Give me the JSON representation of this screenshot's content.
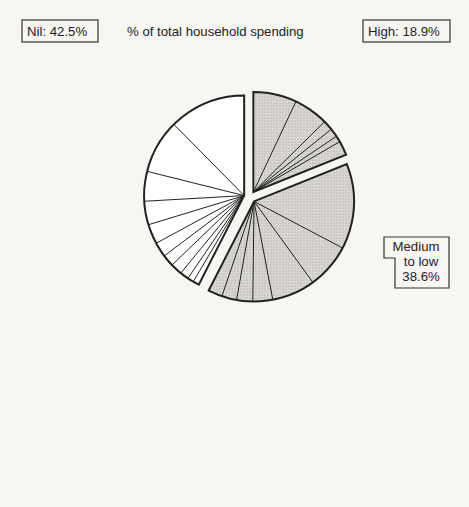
{
  "chart_data": {
    "type": "pie",
    "title": "% of total household spending",
    "groups": [
      {
        "name": "High",
        "label": "High: 18.9%",
        "total": 18.9,
        "fill": "hatched",
        "slices": [
          {
            "label": "Alcohol",
            "value": 7.0
          },
          {
            "label": "Catering and accommodation",
            "value": 5.6
          },
          {
            "label": "Miscellaneous recreational goods",
            "value": 1.6
          },
          {
            "label": "Household maintenance",
            "value": 1.4
          },
          {
            "label": "Domestic services",
            "value": 1.0
          },
          {
            "label": "Other services",
            "value": 2.3
          }
        ]
      },
      {
        "name": "Medium to low",
        "label_lines": [
          "Medium",
          "to low",
          "38.6%"
        ],
        "total": 38.6,
        "fill": "hatched",
        "slices": [
          {
            "label": "Food",
            "value": 13.8
          },
          {
            "label": "Entertainment services (TV purchases; admissions, etc.)",
            "value": 7.3
          },
          {
            "label": "Clothing",
            "value": 7.0
          },
          {
            "label": "Travel",
            "value": 3.2
          },
          {
            "label": "Car repair",
            "value": 2.6
          },
          {
            "label": "Expenditure abroad",
            "value": 2.4
          },
          {
            "label": "Other miscellaneous goods",
            "value": 2.3
          }
        ]
      },
      {
        "name": "Nil",
        "label": "Nil: 42.5%",
        "total": 42.5,
        "fill": "white",
        "slices": [
          {
            "label": "Other households goods",
            "value": 1.0
          },
          {
            "label": "Betting and gaming",
            "value": 1.0
          },
          {
            "label": "Books, newspapers",
            "value": 1.4
          },
          {
            "label": "Insurance",
            "value": 1.9
          },
          {
            "label": "Post, telephone",
            "value": 1.9
          },
          {
            "label": "Chemists goods",
            "value": 2.4
          },
          {
            "label": "Tobacco",
            "value": 3.2
          },
          {
            "label": "Running a car (petrol, licence)",
            "value": 3.8
          },
          {
            "label": "Fuel and light",
            "value": 4.8
          },
          {
            "label": "Durable goods",
            "value": 8.7
          },
          {
            "label": "Housing rent, rates",
            "value": 12.4
          }
        ]
      }
    ],
    "colors": {
      "hatched": "#d4d2cc",
      "white": "#ffffff",
      "outline": "#222222"
    }
  },
  "labels": {
    "nil_box": "Nil: 42.5%",
    "high_box": "High: 18.9%",
    "medium_box": [
      "Medium",
      "to low",
      "38.6%"
    ],
    "title": "% of total household spending",
    "right": [
      [
        "Alcohol 7.0"
      ],
      [
        "Catering and",
        "accommodation 5.6"
      ],
      [
        "Miscellaneous",
        "recreational goods",
        "1.6"
      ],
      [
        "Household",
        "maintenance 1.4"
      ],
      [
        "Domestic",
        "services 1.0"
      ],
      [
        "Other services 2.3"
      ],
      [
        "Food 13.8"
      ],
      [
        "Entertainment",
        "services        7.3",
        "(TV purchases;",
        "admissions, etc.)"
      ],
      [
        "Clothing 7.0"
      ],
      [
        "Travel 3.2"
      ],
      [
        "Car repair 2.6"
      ],
      [
        "Expenditure",
        "abroad     2.4"
      ],
      [
        "Other miscellaneous goods 2.3"
      ]
    ],
    "left": [
      [
        "Housing rent, rates",
        "12.4"
      ],
      [
        "Durable goods 8.7"
      ],
      [
        "Fuel and light 4.8"
      ],
      [
        "Running a car",
        "3.8",
        "(petrol, licence)"
      ],
      [
        "Tobacco 3.2"
      ],
      [
        "Chemists goods",
        "2.4"
      ],
      [
        "Post,",
        "telephone 1.9"
      ],
      [
        "Insurance 1.9"
      ],
      [
        "Books, newspapers",
        "1.4"
      ],
      [
        "Betting and gaming 1.0"
      ],
      [
        "Other households goods 1.0"
      ]
    ]
  }
}
